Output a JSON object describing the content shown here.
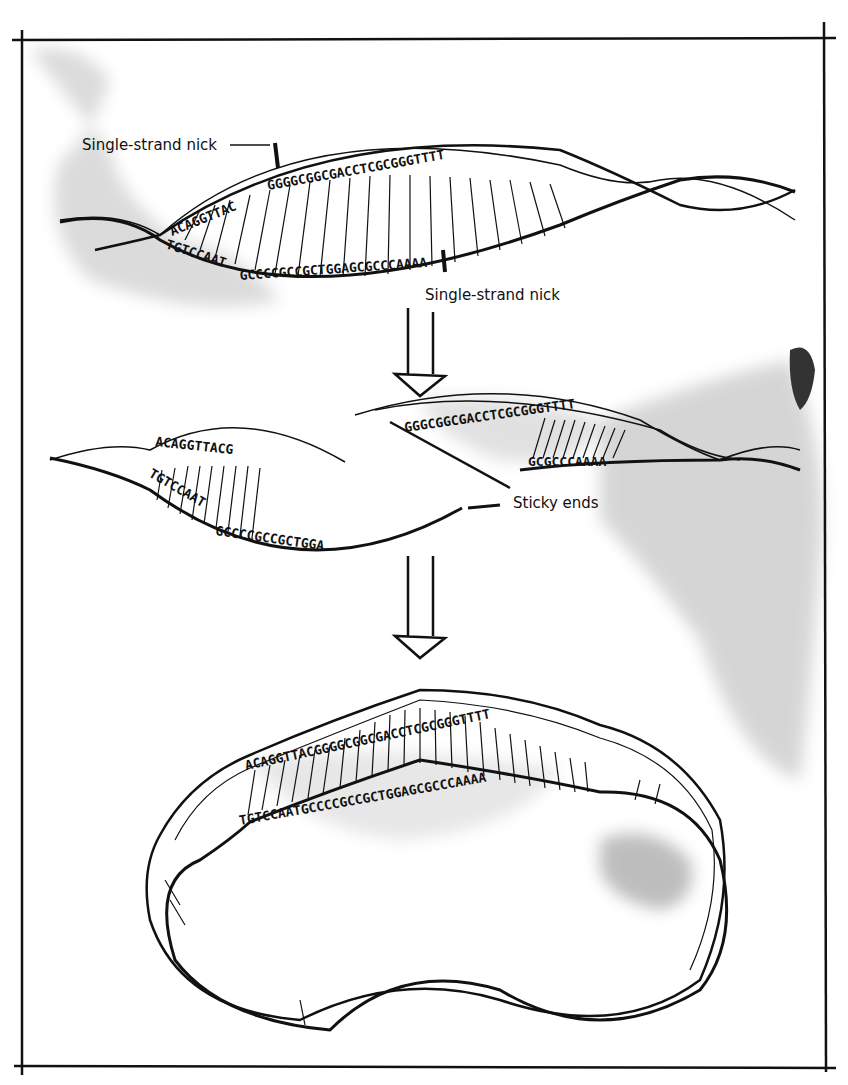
{
  "figure": {
    "title": "",
    "stages": [
      {
        "id": "stage-1-intact",
        "top_strand": "ACAGGTTACGGGGCGGCGACCTCGCGGGTTTT",
        "bottom_strand": "TGTCCAATGCCCCGCCGCTGGAGCGCCCAAAA",
        "labels": [
          "Single-strand nick",
          "Single-strand nick"
        ]
      },
      {
        "id": "stage-2-cut",
        "left_fragment": {
          "top": "ACAGGTTACG",
          "bottom": "TGTCCAATGCCCCGCCGCTGGA"
        },
        "right_fragment": {
          "top": "GGGCGGCGACCTCGCGGGTTTT",
          "bottom": "GCGCCCAAAA"
        },
        "labels": [
          "Sticky ends"
        ]
      },
      {
        "id": "stage-3-circular",
        "top_strand": "ACAGGTTACGGGGCGGCGACCTCGCGGGTTTT",
        "bottom_strand": "TGTCCAATGCCCCGCCGCTGGAGCGCCCAAAA"
      }
    ]
  },
  "labels": {
    "nick_top": "Single-strand nick",
    "nick_bottom": "Single-strand nick",
    "sticky_ends": "Sticky ends"
  }
}
